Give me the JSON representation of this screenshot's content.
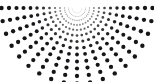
{
  "figure": {
    "width": 154,
    "height": 82,
    "background_color": "#ffffff"
  },
  "chart_data": {
    "type": "scatter",
    "subtitle": "",
    "xlabel": "",
    "ylabel": "",
    "grid": false,
    "legend_position": "none",
    "xlim": [
      0,
      154
    ],
    "ylim": [
      0,
      82
    ],
    "coordinate_system": "polar",
    "origin": {
      "x": 77,
      "y": 8
    },
    "angles_deg": [
      0,
      10,
      20,
      30,
      40,
      50,
      60,
      70,
      80,
      90,
      100,
      110,
      120,
      130,
      140,
      150,
      160,
      170,
      180
    ],
    "angle_count": 19,
    "angle_start_deg": 0,
    "angle_end_deg": 180,
    "radii": [
      5,
      8.5,
      12.5,
      17,
      22,
      27.5,
      33.5,
      40,
      46.5,
      53.5,
      60.5,
      68,
      75.5
    ],
    "ring_count": 13,
    "dot_radii": [
      0.35,
      0.5,
      0.7,
      0.9,
      1.1,
      1.35,
      1.55,
      1.75,
      1.9,
      2.0,
      2.1,
      2.15,
      2.2
    ],
    "dot_opacity": [
      0.22,
      0.3,
      0.4,
      0.52,
      0.65,
      0.78,
      0.88,
      0.95,
      1.0,
      1.0,
      1.0,
      1.0,
      1.0
    ],
    "dot_color": "#16161a",
    "dot_count": 247
  }
}
